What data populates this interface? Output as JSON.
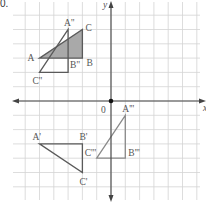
{
  "question_number": "0.",
  "axes": {
    "x_label": "x",
    "y_label": "y",
    "origin_label": "0",
    "grid_unit_px": 14.3,
    "origin_px": [
      111,
      101
    ],
    "x_range": [
      -7,
      6
    ],
    "y_range": [
      -7,
      7
    ]
  },
  "colors": {
    "grid": "#d4d4d4",
    "axis": "#444444",
    "triangle_stroke": "#5a5a5a",
    "triangle_triple_stroke": "#8a8a8a",
    "shaded_fill": "#a9a9a9"
  },
  "triangles": [
    {
      "name": "ABC",
      "shaded": true,
      "vertices": [
        {
          "label": "A",
          "x": -5,
          "y": 3,
          "label_dx": -12,
          "label_dy": 3
        },
        {
          "label": "B",
          "x": -2,
          "y": 3,
          "label_dx": 4,
          "label_dy": 8
        },
        {
          "label": "C",
          "x": -2,
          "y": 5,
          "label_dx": 3,
          "label_dy": 1
        }
      ]
    },
    {
      "name": "A''B''C''",
      "shaded": false,
      "vertices": [
        {
          "label": "A''",
          "x": -3,
          "y": 5,
          "label_dx": -4,
          "label_dy": -4
        },
        {
          "label": "B''",
          "x": -3,
          "y": 2,
          "label_dx": 2,
          "label_dy": -4
        },
        {
          "label": "C''",
          "x": -5,
          "y": 2,
          "label_dx": -7,
          "label_dy": 12
        }
      ]
    },
    {
      "name": "A'B'C'",
      "shaded": false,
      "vertices": [
        {
          "label": "A'",
          "x": -5,
          "y": -3,
          "label_dx": -7,
          "label_dy": -4
        },
        {
          "label": "B'",
          "x": -2,
          "y": -3,
          "label_dx": -3,
          "label_dy": -4
        },
        {
          "label": "C'",
          "x": -2,
          "y": -5,
          "label_dx": -3,
          "label_dy": 12
        }
      ]
    },
    {
      "name": "A'''B'''C'''",
      "shaded": false,
      "triple": true,
      "vertices": [
        {
          "label": "A'''",
          "x": 1,
          "y": -1,
          "label_dx": -3,
          "label_dy": -3
        },
        {
          "label": "B'''",
          "x": 1,
          "y": -4,
          "label_dx": 3,
          "label_dy": -2
        },
        {
          "label": "C'''",
          "x": -1,
          "y": -4,
          "label_dx": -12,
          "label_dy": -2
        }
      ]
    }
  ]
}
